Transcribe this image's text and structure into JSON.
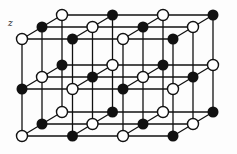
{
  "diagram": {
    "axis_label": "z",
    "colors": {
      "line": "#111111",
      "filled": "#111111",
      "open_fill": "#ffffff",
      "open_stroke": "#111111"
    },
    "atom_radius": 5.5,
    "columns_x_front": [
      22,
      72.5,
      123,
      173
    ],
    "depth_offset": {
      "dx": 20,
      "dy": -12
    },
    "levels_y_front": [
      39,
      89,
      136
    ],
    "depths": 3,
    "pattern_note": "atom type alternates: (i + j + k) even = open, odd = filled; middle level inverted",
    "atoms": [
      {
        "level": 0,
        "depth": 0,
        "col": 0,
        "type": "open"
      },
      {
        "level": 0,
        "depth": 0,
        "col": 1,
        "type": "filled"
      },
      {
        "level": 0,
        "depth": 0,
        "col": 2,
        "type": "open"
      },
      {
        "level": 0,
        "depth": 0,
        "col": 3,
        "type": "filled"
      },
      {
        "level": 0,
        "depth": 1,
        "col": 0,
        "type": "filled"
      },
      {
        "level": 0,
        "depth": 1,
        "col": 1,
        "type": "open"
      },
      {
        "level": 0,
        "depth": 1,
        "col": 2,
        "type": "filled"
      },
      {
        "level": 0,
        "depth": 1,
        "col": 3,
        "type": "open"
      },
      {
        "level": 0,
        "depth": 2,
        "col": 0,
        "type": "open"
      },
      {
        "level": 0,
        "depth": 2,
        "col": 1,
        "type": "filled"
      },
      {
        "level": 0,
        "depth": 2,
        "col": 2,
        "type": "open"
      },
      {
        "level": 0,
        "depth": 2,
        "col": 3,
        "type": "filled"
      },
      {
        "level": 1,
        "depth": 0,
        "col": 0,
        "type": "filled"
      },
      {
        "level": 1,
        "depth": 0,
        "col": 1,
        "type": "open"
      },
      {
        "level": 1,
        "depth": 0,
        "col": 2,
        "type": "filled"
      },
      {
        "level": 1,
        "depth": 0,
        "col": 3,
        "type": "open"
      },
      {
        "level": 1,
        "depth": 1,
        "col": 0,
        "type": "open"
      },
      {
        "level": 1,
        "depth": 1,
        "col": 1,
        "type": "filled"
      },
      {
        "level": 1,
        "depth": 1,
        "col": 2,
        "type": "open"
      },
      {
        "level": 1,
        "depth": 1,
        "col": 3,
        "type": "filled"
      },
      {
        "level": 1,
        "depth": 2,
        "col": 0,
        "type": "filled"
      },
      {
        "level": 1,
        "depth": 2,
        "col": 1,
        "type": "open"
      },
      {
        "level": 1,
        "depth": 2,
        "col": 2,
        "type": "filled"
      },
      {
        "level": 1,
        "depth": 2,
        "col": 3,
        "type": "open"
      },
      {
        "level": 2,
        "depth": 0,
        "col": 0,
        "type": "open"
      },
      {
        "level": 2,
        "depth": 0,
        "col": 1,
        "type": "filled"
      },
      {
        "level": 2,
        "depth": 0,
        "col": 2,
        "type": "open"
      },
      {
        "level": 2,
        "depth": 0,
        "col": 3,
        "type": "filled"
      },
      {
        "level": 2,
        "depth": 1,
        "col": 0,
        "type": "filled"
      },
      {
        "level": 2,
        "depth": 1,
        "col": 1,
        "type": "open"
      },
      {
        "level": 2,
        "depth": 1,
        "col": 2,
        "type": "filled"
      },
      {
        "level": 2,
        "depth": 1,
        "col": 3,
        "type": "open"
      },
      {
        "level": 2,
        "depth": 2,
        "col": 0,
        "type": "open"
      },
      {
        "level": 2,
        "depth": 2,
        "col": 1,
        "type": "filled"
      },
      {
        "level": 2,
        "depth": 2,
        "col": 2,
        "type": "open"
      },
      {
        "level": 2,
        "depth": 2,
        "col": 3,
        "type": "filled"
      }
    ]
  }
}
